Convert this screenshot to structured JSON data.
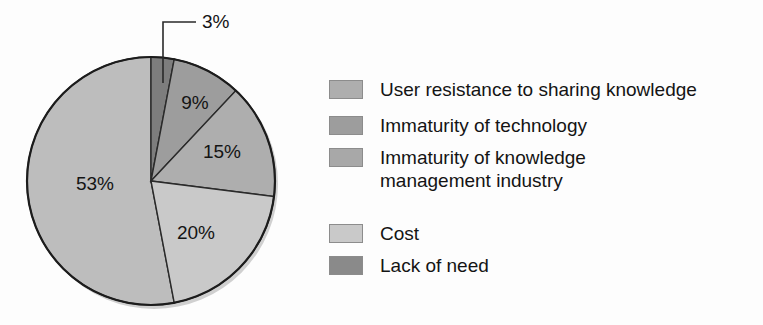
{
  "chart_data": {
    "type": "pie",
    "title": "",
    "subtitle": "",
    "xlabel": "",
    "ylabel": "",
    "legend_position": "right",
    "grid": false,
    "start_angle_deg": 0,
    "direction": "clockwise",
    "categories": [
      "Lack of need",
      "Immaturity of technology",
      "Immaturity of knowledge management industry",
      "Cost",
      "User resistance to sharing knowledge"
    ],
    "values": [
      3,
      9,
      15,
      20,
      53
    ],
    "labels": [
      "3%",
      "9%",
      "15%",
      "20%",
      "53%"
    ],
    "unit": "%",
    "slices": [
      {
        "label": "3%",
        "value": 3,
        "category": "Lack of need",
        "color": "#7d7d7d",
        "callout": true
      },
      {
        "label": "9%",
        "value": 9,
        "category": "Immaturity of technology",
        "color": "#9d9d9d",
        "callout": false
      },
      {
        "label": "15%",
        "value": 15,
        "category": "Immaturity of knowledge management industry",
        "color": "#aeaeae",
        "callout": false
      },
      {
        "label": "20%",
        "value": 20,
        "category": "Cost",
        "color": "#c9c9c9",
        "callout": false
      },
      {
        "label": "53%",
        "value": 53,
        "category": "User resistance to sharing knowledge",
        "color": "#bdbdbd",
        "callout": false
      }
    ]
  },
  "pie": {
    "center_x": 151,
    "center_y": 181,
    "radius": 124,
    "outline_color": "#1c1c1c",
    "label_3": "3%",
    "label_9": "9%",
    "label_15": "15%",
    "label_20": "20%",
    "label_53": "53%"
  },
  "legend": {
    "items": [
      {
        "label": "User resistance to sharing knowledge",
        "color": "#aeaeae"
      },
      {
        "label": "Immaturity of technology",
        "color": "#9d9d9d"
      },
      {
        "label": "Immaturity of knowledge\nmanagement industry",
        "color": "#a8a8a8"
      },
      {
        "label": "Cost",
        "color": "#c9c9c9"
      },
      {
        "label": "Lack of need",
        "color": "#8a8a8a"
      }
    ]
  }
}
